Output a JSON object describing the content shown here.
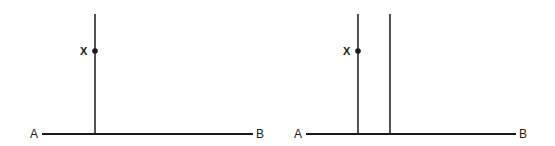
{
  "diagrams": [
    {
      "id": "left",
      "baseline": {
        "start_label": "A",
        "end_label": "B"
      },
      "verticals": 1,
      "point": {
        "label": "X"
      }
    },
    {
      "id": "right",
      "baseline": {
        "start_label": "A",
        "end_label": "B"
      },
      "verticals": 2,
      "point": {
        "label": "X"
      }
    }
  ],
  "colors": {
    "line": "#1a1a1a",
    "background": "#ffffff"
  }
}
